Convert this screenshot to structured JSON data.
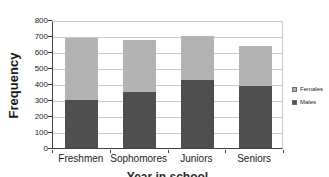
{
  "chart_data": {
    "type": "bar",
    "stacked": true,
    "title": "",
    "categories": [
      "Freshmen",
      "Sophomores",
      "Juniors",
      "Seniors"
    ],
    "series": [
      {
        "name": "Males",
        "values": [
          300,
          350,
          425,
          390
        ],
        "color": "#4f4f4f"
      },
      {
        "name": "Females",
        "values": [
          390,
          325,
          275,
          250
        ],
        "color": "#b3b3b3"
      }
    ],
    "totals": [
      690,
      675,
      700,
      640
    ],
    "ylabel": "Frequency",
    "xlabel": "Year in school",
    "xlabel_note": "cut off at bottom edge, only letter tops visible",
    "ylim": [
      0,
      800
    ],
    "ytick_step": 100,
    "ytick_labels": [
      "0",
      "100",
      "200",
      "300",
      "400",
      "500",
      "600",
      "700",
      "800"
    ],
    "grid": true,
    "legend_position": "right",
    "legend_order": [
      "Females",
      "Males"
    ],
    "colors": {
      "males": "#4f4f4f",
      "females": "#b3b3b3",
      "gridline": "#c9c9c9",
      "axis": "#3f3f3f",
      "text": "#1a1a1a",
      "background": "#ffffff"
    }
  }
}
